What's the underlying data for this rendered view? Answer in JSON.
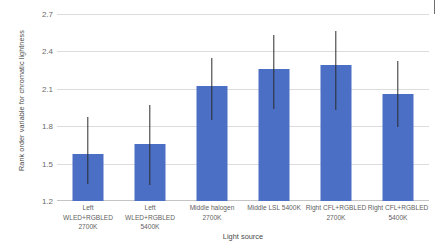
{
  "chart_data": {
    "type": "bar",
    "title": "",
    "xlabel": "Light source",
    "ylabel": "Rank order variable for chromatic lightness",
    "ylim": [
      1.2,
      2.7
    ],
    "yticks": [
      "1.2",
      "1.5",
      "1.8",
      "2.1",
      "2.4",
      "2.7"
    ],
    "ytick_values": [
      1.2,
      1.5,
      1.8,
      2.1,
      2.4,
      2.7
    ],
    "grid": true,
    "legend": "none",
    "bar_color": "#4a6fc4",
    "error_color": "#2b2b2b",
    "categories": [
      "Left WLED+RGBLED\n2700K",
      "Left WLED+RGBLED\n5400K",
      "Middle halogen\n2700K",
      "Middle LSL 5400K",
      "Right CFL+RGBLED\n2700K",
      "Right CFL+RGBLED\n5400K"
    ],
    "values": [
      1.58,
      1.66,
      2.12,
      2.26,
      2.29,
      2.06
    ],
    "error_low": [
      1.34,
      1.33,
      1.85,
      1.94,
      1.93,
      1.79
    ],
    "error_high": [
      1.87,
      1.97,
      2.35,
      2.53,
      2.56,
      2.32
    ]
  }
}
